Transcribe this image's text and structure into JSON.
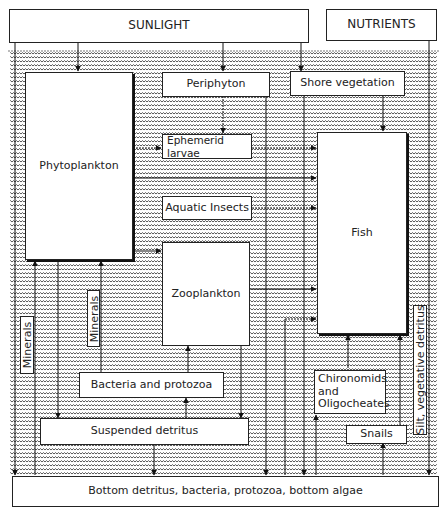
{
  "inputs": {
    "sunlight": "SUNLIGHT",
    "nutrients": "NUTRIENTS"
  },
  "nodes": {
    "phytoplankton": "Phytoplankton",
    "periphyton": "Periphyton",
    "shore_vegetation": "Shore vegetation",
    "ephemerid_larvae": "Ephemerid larvae",
    "aquatic_insects": "Aquatic Insects",
    "fish": "Fish",
    "zooplankton": "Zooplankton",
    "bacteria_protozoa": "Bacteria and protozoa",
    "suspended_detritus": "Suspended detritus",
    "chironomids": "Chironomids and Oligocheates",
    "snails": "Snails",
    "minerals_left": "Minerals",
    "minerals_mid": "Minerals",
    "silt_detritus": "Silt, vegetative detritus",
    "bottom": "Bottom detritus, bacteria, protozoa, bottom algae"
  },
  "colors": {
    "line": "#1a1a1a",
    "box_fill": "#ffffff",
    "water_pattern": "#555555"
  }
}
